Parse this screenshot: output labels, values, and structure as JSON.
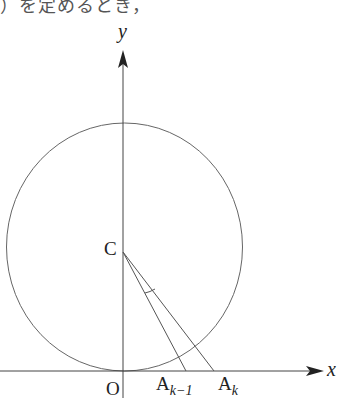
{
  "caption": "）を定めるとき，",
  "labels": {
    "y_axis": "y",
    "x_axis": "x",
    "center": "C",
    "origin": "O",
    "a_prev_base": "A",
    "a_prev_sub": "k−1",
    "a_curr_base": "A",
    "a_curr_sub": "k"
  },
  "geometry": {
    "circle": {
      "cx": 124.5,
      "cy": 247,
      "rx": 118,
      "ry": 124
    },
    "y_axis_x": 123,
    "x_axis_y": 371,
    "A_prev_x": 186,
    "A_curr_x": 214
  },
  "colors": {
    "stroke": "#555555",
    "axis": "#444444",
    "text": "#222222"
  }
}
